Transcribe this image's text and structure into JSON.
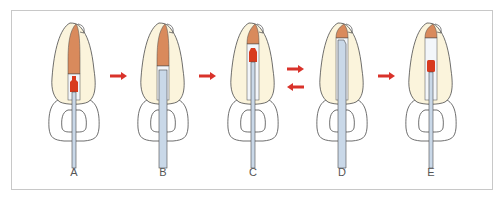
{
  "figure": {
    "panels": [
      {
        "id": "A",
        "label": "A",
        "cx": 74,
        "instrument": "thin",
        "plug": "apical",
        "gutta": "full"
      },
      {
        "id": "B",
        "label": "B",
        "cx": 163,
        "instrument": "wide",
        "plug": "none",
        "gutta": "upper"
      },
      {
        "id": "C",
        "label": "C",
        "cx": 253,
        "instrument": "thin",
        "plug": "coronal",
        "gutta": "short"
      },
      {
        "id": "D",
        "label": "D",
        "cx": 342,
        "instrument": "wide",
        "plug": "none",
        "gutta": "tip"
      },
      {
        "id": "E",
        "label": "E",
        "cx": 431,
        "instrument": "thin",
        "plug": "middle",
        "gutta": "tip"
      }
    ],
    "arrows": [
      {
        "between": "A-B",
        "direction": "right"
      },
      {
        "between": "B-C",
        "direction": "right"
      },
      {
        "between": "C-D",
        "direction": "right-and-left"
      },
      {
        "between": "D-E",
        "direction": "right"
      }
    ],
    "colors": {
      "enamel": "#fbf4dc",
      "gutta": "#d98a5c",
      "plug": "#d83a1e",
      "instrument": "#c9d8e8",
      "outline": "#4a4a4a",
      "arrow": "#d9322a",
      "canal": "#f3f6fa"
    }
  }
}
